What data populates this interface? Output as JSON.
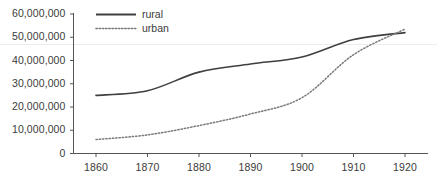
{
  "chart_data": {
    "type": "line",
    "title": "",
    "subtitle": "",
    "xlabel": "",
    "ylabel": "",
    "x": [
      1860,
      1870,
      1880,
      1890,
      1900,
      1910,
      1920
    ],
    "xlim": [
      1855,
      1925
    ],
    "ylim": [
      0,
      60000000
    ],
    "grid": false,
    "legend_position": "top-left",
    "x_tick_labels": [
      "1860",
      "1870",
      "1880",
      "1890",
      "1900",
      "1910",
      "1920"
    ],
    "y_tick_labels": [
      "0",
      "10,000,000",
      "20,000,000",
      "30,000,000",
      "40,000,000",
      "50,000,000",
      "60,000,000"
    ],
    "y_ticks": [
      0,
      10000000,
      20000000,
      30000000,
      40000000,
      50000000,
      60000000
    ],
    "series": [
      {
        "name": "rural",
        "style": "solid",
        "color": "#3f3f3f",
        "values": [
          25000000,
          27000000,
          35000000,
          38500000,
          41500000,
          49000000,
          52000000
        ]
      },
      {
        "name": "urban",
        "style": "dotted",
        "color": "#7a7a7a",
        "values": [
          6000000,
          8000000,
          12000000,
          17000000,
          24000000,
          42500000,
          53500000
        ]
      }
    ]
  },
  "legend": {
    "items": [
      {
        "label": "rural",
        "style": "solid"
      },
      {
        "label": "urban",
        "style": "dotted"
      }
    ]
  },
  "axes": {
    "axis_color": "#555555",
    "label_color": "#3a3a3a"
  }
}
